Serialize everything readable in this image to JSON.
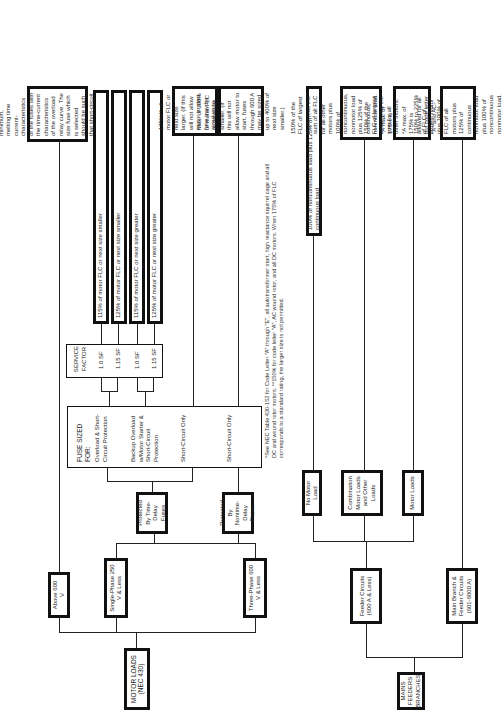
{
  "motor": {
    "root": "MOTOR LOADS (NEC 430)",
    "above600": "Above 600 V",
    "single": "Single-Phase 250 V & Less",
    "three": "Three-Phase 600 V & Less",
    "timedelay": "Protected By Time-Delay Fuses",
    "nontime": "Protected By Nontime-Delay Fuses",
    "fuse_title": "FUSE SIZED FOR:",
    "fuse_items": [
      "Overload & Short-Circuit Protection",
      "Backup Overload w/Motor Starter & Short-Circuit Protection",
      "Short-Circuit Only",
      "Short-Circuit Only"
    ],
    "sf_title": "SERVICE FACTOR",
    "sf_items": [
      "1.0 SF",
      "1.15 SF",
      "1.0 SF",
      "1.15 SF"
    ],
    "compare": "Compare the minimum, melting time current-characteristics of the fuses with the time-current characteristics of the overload relay curve. The size fuse which is selected should be such that short-circuit protection is provided by the controller overload relays",
    "sf_results": [
      "115% of motor FLC or next size smaller",
      "125% of motor FLC or next size smaller",
      "115% of motor FLC or next size greater",
      "125% of motor FLC or next size greater"
    ],
    "sc_td": "175%** of motor FLC or next size larger. (If this will not allow motor to start, fuse may be sized up to 225% of next size smaller)",
    "sc_ntd": "Max. of 300% of motor FLC or next size smaller. (If this will not allow motor to start, fuses through 600 A may be sized up to 400% of next size smaller.)",
    "footnote": "*See NEC Table 430-152 for Code Letter \"A\" through \"E\", all autotransformer start, high reactance squirrel cage and all DC and wound rotor motors. **150% for code letter \"A\", AC wound rotor, and all DC motors. When 175% of FLC corresponds to a standard rating, the larger size is not permitted."
  },
  "mains": {
    "root": "MAINS FEEDERS BRANCHES",
    "feeder": "Feeder Circuits (600 A & Less)",
    "main": "Main Branch & Feeder Circuits (601-6000 A)",
    "nomotor": "No Motor Load",
    "combo": "Combination Motor Loads and Other Loads",
    "motorloads": "Motor Loads",
    "nomotor_r": "100% of noncontinuous load plus 125% of continuous load",
    "combo_r": "150% of the FLC of largest motor plus the sum of all FLC for all other motors plus 100% of noncontinuous, nonmotor load plus 125% of continuous, nonmotor load. *A max. of 175% is allowed for all but code letter \"A\" and AC wound rotor & DC motors.",
    "motor_r": "150% of the FLC of largest motor plus the sum for all other motors. *A max. of 175% is allowed for all but code letter \"A\" and AC-wound rotor and all DC motors.",
    "main_r": "150% to 225% of FLC of largest motor plus 100% of FLC of all motors plus 125% of continuous nonmotor load plus 100% of noncontinuous nonmotor load."
  }
}
